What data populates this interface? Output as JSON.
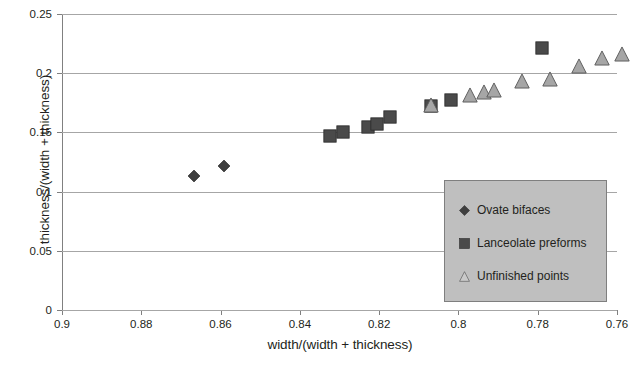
{
  "chart_data": {
    "type": "scatter",
    "title": "",
    "xlabel": "width/(width + thickness)",
    "ylabel": "thickness/(width + thickness)",
    "xlim": [
      0.9,
      0.76
    ],
    "ylim": [
      0,
      0.25
    ],
    "x_axis_reversed": true,
    "grid": true,
    "legend_position": "inside-bottom-right",
    "xticks": [
      "0.9",
      "0.88",
      "0.86",
      "0.84",
      "0.82",
      "0.8",
      "0.78",
      "0.76"
    ],
    "xtick_values": [
      0.9,
      0.88,
      0.86,
      0.84,
      0.82,
      0.8,
      0.78,
      0.76
    ],
    "yticks": [
      "0",
      "0.05",
      "0.1",
      "0.15",
      "0.2",
      "0.25"
    ],
    "ytick_values": [
      0,
      0.05,
      0.1,
      0.15,
      0.2,
      0.25
    ],
    "series": [
      {
        "name": "Ovate bifaces",
        "marker": "diamond",
        "color": "#3f3f3f",
        "points": [
          [
            0.8667,
            0.1135
          ],
          [
            0.8592,
            0.1215
          ]
        ]
      },
      {
        "name": "Lanceolate preforms",
        "marker": "square",
        "color": "#4a4a4a",
        "points": [
          [
            0.8325,
            0.147
          ],
          [
            0.8292,
            0.1505
          ],
          [
            0.8228,
            0.1545
          ],
          [
            0.8205,
            0.157
          ],
          [
            0.8172,
            0.163
          ],
          [
            0.8068,
            0.172
          ],
          [
            0.8018,
            0.1775
          ],
          [
            0.779,
            0.221
          ]
        ]
      },
      {
        "name": "Unfinished points",
        "marker": "triangle",
        "color": "#a6a6a6",
        "points": [
          [
            0.807,
            0.1735
          ],
          [
            0.7972,
            0.182
          ],
          [
            0.7936,
            0.1845
          ],
          [
            0.7911,
            0.186
          ],
          [
            0.784,
            0.1935
          ],
          [
            0.777,
            0.1955
          ],
          [
            0.7695,
            0.2065
          ],
          [
            0.7637,
            0.2125
          ],
          [
            0.7587,
            0.2165
          ]
        ]
      }
    ]
  },
  "legend": {
    "items": [
      {
        "label": "Ovate bifaces",
        "marker": "diamond",
        "color": "#3f3f3f"
      },
      {
        "label": "Lanceolate preforms",
        "marker": "square",
        "color": "#4a4a4a"
      },
      {
        "label": "Unfinished points",
        "marker": "triangle",
        "color": "#c9c9c9"
      }
    ]
  }
}
